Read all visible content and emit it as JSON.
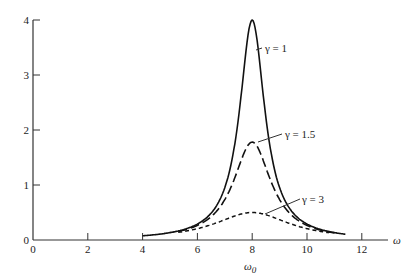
{
  "chart_data": {
    "type": "line",
    "title": "",
    "xlabel": "ω",
    "xlabel_sub": "ω0",
    "ylabel": "",
    "xlim": [
      0,
      13
    ],
    "ylim": [
      0,
      4
    ],
    "x_ticks": [
      "0",
      "2",
      "4",
      "6",
      "8",
      "10",
      "12"
    ],
    "y_ticks": [
      "0",
      "1",
      "2",
      "3",
      "4"
    ],
    "grid": false,
    "legend": "inline annotations",
    "series": [
      {
        "name": "γ = 1",
        "style": "solid",
        "peak_x": 8,
        "peak_y": 4.0,
        "x": [
          4,
          5,
          6,
          7,
          7.5,
          8,
          8.5,
          9,
          10,
          11,
          11.4
        ],
        "y": [
          0.08,
          0.14,
          0.31,
          1.0,
          2.1,
          4.0,
          2.1,
          1.0,
          0.31,
          0.14,
          0.11
        ]
      },
      {
        "name": "γ = 1.5",
        "style": "long-dash",
        "peak_x": 8,
        "peak_y": 1.78,
        "x": [
          5.3,
          6,
          7,
          7.5,
          8,
          8.5,
          9,
          10,
          11
        ],
        "y": [
          0.17,
          0.28,
          0.75,
          1.3,
          1.78,
          1.3,
          0.75,
          0.28,
          0.14
        ]
      },
      {
        "name": "γ = 3",
        "style": "short-dash",
        "peak_x": 8,
        "peak_y": 0.5,
        "x": [
          5.3,
          6,
          7,
          8,
          9,
          10,
          10.8
        ],
        "y": [
          0.12,
          0.22,
          0.38,
          0.5,
          0.38,
          0.22,
          0.12
        ]
      }
    ],
    "annotations": [
      "γ = 1",
      "γ = 1.5",
      "γ = 3"
    ]
  }
}
